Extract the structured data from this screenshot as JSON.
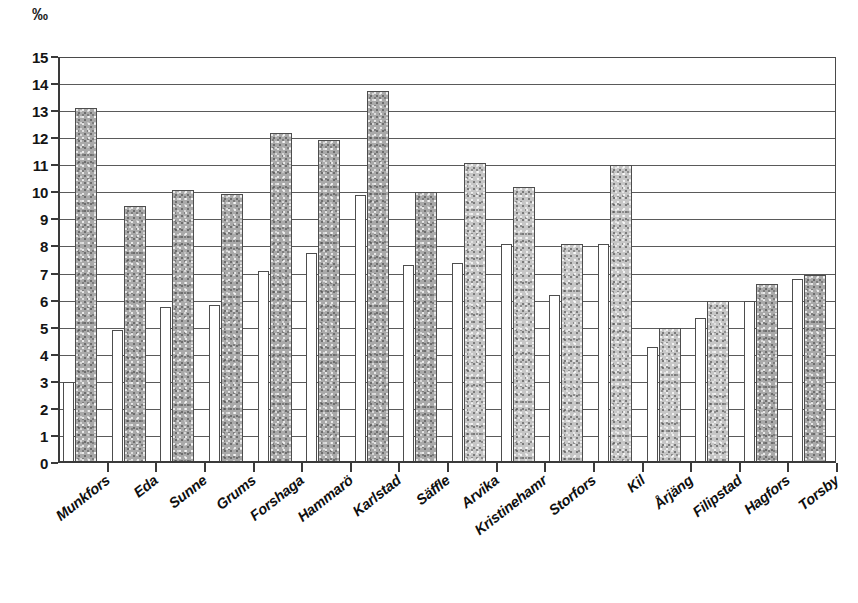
{
  "unit_label": "‰",
  "axis": {
    "y_ticks": [
      0,
      1,
      2,
      3,
      4,
      5,
      6,
      7,
      8,
      9,
      10,
      11,
      12,
      13,
      14,
      15
    ]
  },
  "chart_data": {
    "type": "bar",
    "title": "",
    "subtitle": "",
    "xlabel": "",
    "ylabel": "‰",
    "ylim": [
      0,
      15
    ],
    "ytick_step": 1,
    "grid": true,
    "legend_position": "none",
    "orientation": "vertical",
    "grouping": "grouped",
    "categories": [
      "Munkfors",
      "Eda",
      "Sunne",
      "Grums",
      "Forshaga",
      "Hammarö",
      "Karlstad",
      "Säffle",
      "Arvika",
      "Kristinehamn",
      "Storfors",
      "Kil",
      "Årjäng",
      "Filipstad",
      "Hagfors",
      "Torsby"
    ],
    "category_labels_as_printed": [
      "Munkfors",
      "Eda",
      "Sunne",
      "Grums",
      "Forshaga",
      "Hammarö",
      "Karlstad",
      "Säffle",
      "Arvika",
      "Kristinehamr",
      "Storfors",
      "Kil",
      "Årjäng",
      "Filipstad",
      "Hagfors",
      "Torsby"
    ],
    "series": [
      {
        "name": "series-1",
        "style": "white",
        "color": "#ffffff",
        "values": [
          3.0,
          4.9,
          5.75,
          5.85,
          7.1,
          7.75,
          9.9,
          7.3,
          7.4,
          8.1,
          6.2,
          8.1,
          4.3,
          5.35,
          6.0,
          6.8
        ]
      },
      {
        "name": "series-2",
        "style": "grey-textured",
        "color": "#a9a9a9",
        "values": [
          13.1,
          9.5,
          10.1,
          9.95,
          12.2,
          11.95,
          13.75,
          10.0,
          11.1,
          10.2,
          8.1,
          11.0,
          5.0,
          6.0,
          6.6,
          6.95
        ]
      }
    ]
  }
}
